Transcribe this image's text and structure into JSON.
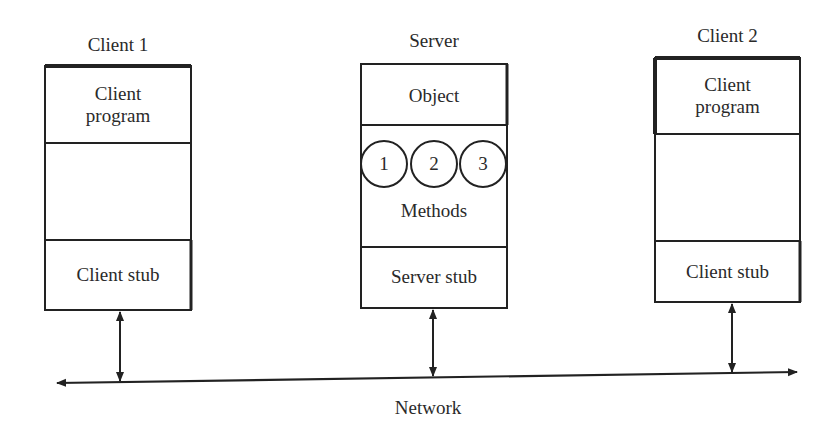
{
  "diagram": {
    "type": "client-server-rpc",
    "nodes": [
      {
        "id": "client1",
        "title": "Client 1",
        "sections": [
          "Client\nprogram",
          "",
          "Client stub"
        ],
        "top_label_lines": [
          "Client",
          "program"
        ],
        "stub_label": "Client stub"
      },
      {
        "id": "server",
        "title": "Server",
        "object_label": "Object",
        "methods": [
          "1",
          "2",
          "3"
        ],
        "methods_label": "Methods",
        "stub_label": "Server stub"
      },
      {
        "id": "client2",
        "title": "Client 2",
        "top_label_lines": [
          "Client",
          "program"
        ],
        "stub_label": "Client stub"
      }
    ],
    "network": {
      "label": "Network",
      "bidirectional": true
    },
    "edges": [
      {
        "from": "client1",
        "to": "network",
        "bidirectional": true
      },
      {
        "from": "server",
        "to": "network",
        "bidirectional": true
      },
      {
        "from": "client2",
        "to": "network",
        "bidirectional": true
      }
    ]
  }
}
